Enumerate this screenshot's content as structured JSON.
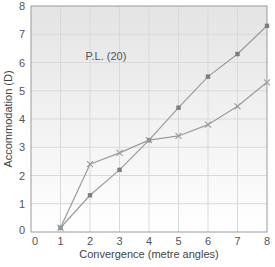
{
  "chart_data": {
    "type": "line",
    "title": "",
    "xlabel": "Convergence (metre angles)",
    "ylabel": "Accommodation (D)",
    "xlim": [
      0,
      8
    ],
    "ylim": [
      0,
      8
    ],
    "x_ticks": [
      "0",
      "1",
      "2",
      "3",
      "4",
      "5",
      "6",
      "7",
      "8"
    ],
    "y_ticks": [
      "0",
      "1",
      "2",
      "3",
      "4",
      "5",
      "6",
      "7",
      "8"
    ],
    "grid": true,
    "legend": null,
    "annotations": [
      {
        "text": "P.L. (20)",
        "x": 1.85,
        "y": 6.1
      }
    ],
    "x": [
      1,
      2,
      3,
      4,
      5,
      6,
      7,
      8
    ],
    "series": [
      {
        "name": "square-marker-series",
        "marker": "square",
        "color": "#8a8a8a",
        "values": [
          0.15,
          1.3,
          2.2,
          3.25,
          4.4,
          5.5,
          6.3,
          7.3
        ]
      },
      {
        "name": "cross-marker-series",
        "marker": "cross",
        "color": "#9a9a9a",
        "values": [
          0.15,
          2.4,
          2.8,
          3.25,
          3.4,
          3.8,
          4.45,
          5.3
        ]
      }
    ]
  },
  "colors": {
    "plot_bg_top": "#e6e6e6",
    "plot_bg_bottom": "#ffffff",
    "grid": "#d9d9d9",
    "axis": "#9a9a9a",
    "line": "#9c9c9c"
  }
}
